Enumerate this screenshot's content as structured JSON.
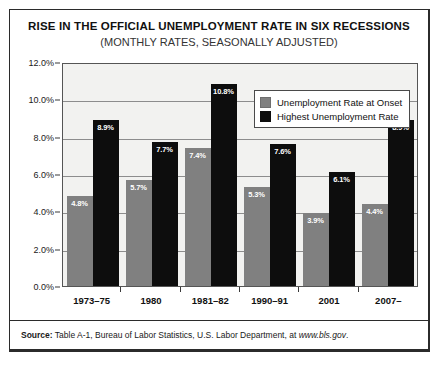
{
  "chart_data": {
    "type": "bar",
    "title": "RISE IN THE OFFICIAL UNEMPLOYMENT RATE IN SIX RECESSIONS",
    "subtitle": "(MONTHLY RATES, SEASONALLY ADJUSTED)",
    "xlabel": "",
    "ylabel": "",
    "ylim": [
      0,
      12
    ],
    "grid": true,
    "legend_position": "top-right",
    "categories": [
      "1973–75",
      "1980",
      "1981–82",
      "1990–91",
      "2001",
      "2007–"
    ],
    "y_ticks": [
      "0.0%",
      "2.0%",
      "4.0%",
      "6.0%",
      "8.0%",
      "10.0%",
      "12.0%"
    ],
    "y_tick_values": [
      0,
      2,
      4,
      6,
      8,
      10,
      12
    ],
    "series": [
      {
        "name": "Unemployment Rate at Onset",
        "color": "#808080",
        "values": [
          4.8,
          5.7,
          7.4,
          5.3,
          3.9,
          4.4
        ],
        "labels": [
          "4.8%",
          "5.7%",
          "7.4%",
          "5.3%",
          "3.9%",
          "4.4%"
        ]
      },
      {
        "name": "Highest Unemployment Rate",
        "color": "#0d0d0d",
        "values": [
          8.9,
          7.7,
          10.8,
          7.6,
          6.1,
          8.9
        ],
        "labels": [
          "8.9%",
          "7.7%",
          "10.8%",
          "7.6%",
          "6.1%",
          "8.9%"
        ]
      }
    ]
  },
  "source": {
    "lead": "Source:",
    "text": " Table A-1,  Bureau of Labor Statistics, U.S. Labor Department, at ",
    "site": "www.bls.gov",
    "end": "."
  }
}
